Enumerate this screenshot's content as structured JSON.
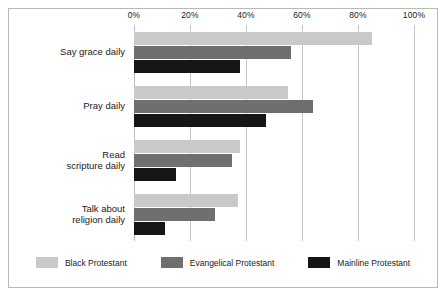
{
  "chart_data": {
    "type": "bar",
    "orientation": "horizontal",
    "title": "",
    "subtitle": "",
    "xlabel": "",
    "ylabel": "",
    "xlim": [
      0,
      100
    ],
    "xticks": [
      0,
      20,
      40,
      60,
      80,
      100
    ],
    "xticklabels": [
      "0%",
      "20%",
      "40%",
      "60%",
      "80%",
      "100%"
    ],
    "grid": "vertical",
    "legend_position": "bottom-center",
    "categories": [
      "Say grace daily",
      "Pray daily",
      "Read\nscripture daily",
      "Talk about\nreligion daily"
    ],
    "series": [
      {
        "name": "Black Protestant",
        "color": "#c9c9c9",
        "values": [
          85,
          55,
          38,
          37
        ]
      },
      {
        "name": "Evangelical Protestant",
        "color": "#6f6f6f",
        "values": [
          56,
          64,
          35,
          29
        ]
      },
      {
        "name": "Mainline Protestant",
        "color": "#161616",
        "values": [
          38,
          47,
          15,
          11
        ]
      }
    ]
  },
  "legend": {
    "items": [
      {
        "label": "Black Protestant"
      },
      {
        "label": "Evangelical Protestant"
      },
      {
        "label": "Mainline Protestant"
      }
    ]
  }
}
